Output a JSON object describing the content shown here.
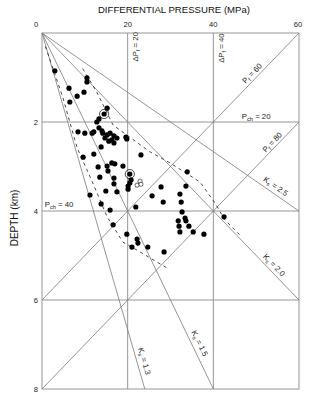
{
  "chart_data": {
    "type": "scatter",
    "title": "DIFFERENTIAL PRESSURE (MPa)",
    "xlabel": "DIFFERENTIAL PRESSURE (MPa)",
    "ylabel": "DEPTH (km)",
    "xlim": [
      0,
      60
    ],
    "ylim": [
      0,
      8
    ],
    "y_inverted": true,
    "x_axis_position": "top",
    "x_ticks": [
      0,
      20,
      40,
      60
    ],
    "y_ticks": [
      2,
      4,
      6,
      8
    ],
    "grid": {
      "horizontal_depths": [
        2,
        4,
        6
      ],
      "vertical_pressures": [
        20,
        40
      ]
    },
    "reference_lines": [
      {
        "name": "Pf = 60",
        "kind": "pore-pressure",
        "from": [
          60,
          0
        ],
        "to": [
          0,
          6
        ]
      },
      {
        "name": "Pf = 80",
        "kind": "pore-pressure",
        "from": [
          60,
          2
        ],
        "to": [
          0,
          8
        ]
      },
      {
        "name": "Ks = 1.3",
        "kind": "stress-ratio",
        "from": [
          0,
          0
        ],
        "to": [
          24,
          8
        ]
      },
      {
        "name": "Ks = 1.5",
        "kind": "stress-ratio",
        "from": [
          0,
          0
        ],
        "to": [
          40,
          8
        ]
      },
      {
        "name": "Ks = 2.0",
        "kind": "stress-ratio",
        "from": [
          0,
          0
        ],
        "to": [
          60,
          6
        ]
      },
      {
        "name": "Ks = 2.5",
        "kind": "stress-ratio",
        "from": [
          0,
          0
        ],
        "to": [
          60,
          4
        ]
      }
    ],
    "envelopes": [
      {
        "name": "left-envelope",
        "style": "dashed",
        "points": [
          [
            0.8,
            0.3
          ],
          [
            4.9,
            1.46
          ],
          [
            8.2,
            2.58
          ],
          [
            12.0,
            3.4
          ],
          [
            15.2,
            4.13
          ],
          [
            18.9,
            4.7
          ],
          [
            22.9,
            4.92
          ],
          [
            26.9,
            5.15
          ],
          [
            29.2,
            5.28
          ]
        ]
      },
      {
        "name": "right-envelope",
        "style": "dashed",
        "points": [
          [
            9.5,
            0.8
          ],
          [
            12.8,
            1.33
          ],
          [
            16.6,
            2.07
          ],
          [
            25.2,
            2.67
          ],
          [
            29.9,
            2.92
          ],
          [
            36.9,
            3.35
          ],
          [
            40.4,
            3.82
          ],
          [
            42.7,
            4.2
          ],
          [
            46.2,
            4.54
          ]
        ]
      }
    ],
    "series": [
      {
        "name": "measured",
        "marker": "filled-circle",
        "points": [
          [
            3.0,
            0.85
          ],
          [
            10.5,
            1.01
          ],
          [
            10.5,
            1.1
          ],
          [
            6.3,
            1.24
          ],
          [
            9.8,
            1.33
          ],
          [
            8.2,
            1.42
          ],
          [
            6.5,
            1.55
          ],
          [
            15.2,
            1.69
          ],
          [
            14.5,
            1.82
          ],
          [
            13.3,
            1.93
          ],
          [
            12.8,
            2.0
          ],
          [
            13.3,
            2.13
          ],
          [
            8.4,
            2.22
          ],
          [
            10.0,
            2.25
          ],
          [
            11.7,
            2.25
          ],
          [
            12.1,
            2.22
          ],
          [
            14.0,
            2.2
          ],
          [
            14.2,
            2.25
          ],
          [
            15.2,
            2.29
          ],
          [
            15.9,
            2.25
          ],
          [
            16.8,
            2.31
          ],
          [
            17.5,
            2.36
          ],
          [
            14.7,
            2.36
          ],
          [
            16.3,
            2.4
          ],
          [
            19.6,
            2.34
          ],
          [
            19.8,
            2.38
          ],
          [
            15.6,
            2.43
          ],
          [
            16.8,
            2.47
          ],
          [
            13.8,
            2.56
          ],
          [
            9.6,
            2.79
          ],
          [
            12.1,
            2.72
          ],
          [
            23.1,
            2.74
          ],
          [
            13.1,
            3.01
          ],
          [
            15.2,
            2.99
          ],
          [
            16.3,
            2.92
          ],
          [
            17.0,
            2.94
          ],
          [
            18.9,
            2.99
          ],
          [
            15.4,
            3.1
          ],
          [
            13.5,
            3.24
          ],
          [
            16.8,
            3.26
          ],
          [
            20.5,
            3.17
          ],
          [
            20.8,
            3.3
          ],
          [
            20.5,
            3.37
          ],
          [
            20.1,
            3.44
          ],
          [
            20.1,
            3.51
          ],
          [
            16.8,
            3.39
          ],
          [
            14.9,
            3.55
          ],
          [
            17.5,
            3.57
          ],
          [
            11.2,
            3.64
          ],
          [
            13.8,
            3.84
          ],
          [
            15.9,
            3.98
          ],
          [
            21.9,
            3.91
          ],
          [
            16.6,
            4.31
          ],
          [
            33.9,
            3.12
          ],
          [
            27.8,
            3.46
          ],
          [
            33.6,
            3.44
          ],
          [
            25.7,
            3.66
          ],
          [
            28.3,
            3.8
          ],
          [
            32.2,
            3.62
          ],
          [
            32.5,
            3.8
          ],
          [
            32.7,
            4.02
          ],
          [
            33.4,
            4.16
          ],
          [
            33.6,
            4.22
          ],
          [
            31.8,
            4.22
          ],
          [
            32.0,
            4.34
          ],
          [
            34.3,
            4.34
          ],
          [
            32.2,
            4.47
          ],
          [
            35.3,
            4.47
          ],
          [
            37.8,
            4.52
          ],
          [
            42.5,
            4.13
          ],
          [
            19.8,
            4.52
          ],
          [
            22.2,
            4.63
          ],
          [
            22.4,
            4.72
          ],
          [
            21.0,
            4.81
          ],
          [
            24.7,
            4.81
          ],
          [
            28.5,
            4.92
          ]
        ]
      },
      {
        "name": "highlighted",
        "marker": "circled-filled-circle",
        "points": [
          [
            14.5,
            1.82
          ],
          [
            20.5,
            3.17
          ]
        ]
      },
      {
        "name": "open",
        "marker": "open-circle",
        "points": [
          [
            22.2,
            3.42
          ],
          [
            22.9,
            3.33
          ],
          [
            23.1,
            3.4
          ]
        ]
      }
    ],
    "annotations": [
      {
        "id": "dpf-20",
        "base": "ΔP",
        "sub": "f",
        "tail": " = 20",
        "at": [
          21.7,
          0.31
        ],
        "angle": -90
      },
      {
        "id": "dpf-40",
        "base": "ΔP",
        "sub": "f",
        "tail": " = 40",
        "at": [
          41.8,
          0.34
        ],
        "angle": -90
      },
      {
        "id": "pf-60",
        "base": "P",
        "sub": "f",
        "tail": " = 60",
        "at": [
          49.0,
          0.9
        ],
        "angle": -46
      },
      {
        "id": "pch-20",
        "base": "P",
        "sub": "ch",
        "tail": " = 20",
        "at": [
          50.0,
          1.87
        ],
        "angle": 0
      },
      {
        "id": "pf-80",
        "base": "P",
        "sub": "f",
        "tail": " = 80",
        "at": [
          53.7,
          2.45
        ],
        "angle": -46
      },
      {
        "id": "ks-2-5",
        "base": "K",
        "sub": "s",
        "tail": " = 2.5",
        "at": [
          54.6,
          3.44
        ],
        "angle": 35
      },
      {
        "id": "pch-40",
        "base": "P",
        "sub": "ch",
        "tail": " = 40",
        "at": [
          4.0,
          3.84
        ],
        "angle": 0
      },
      {
        "id": "ks-2-0",
        "base": "K",
        "sub": "s",
        "tail": " = 2.0",
        "at": [
          54.2,
          5.21
        ],
        "angle": 46
      },
      {
        "id": "ks-1-5",
        "base": "K",
        "sub": "s",
        "tail": " = 1.5",
        "at": [
          36.9,
          6.97
        ],
        "angle": 64
      },
      {
        "id": "ks-1-3",
        "base": "K",
        "sub": "s",
        "tail": " = 1.3",
        "at": [
          24.0,
          7.37
        ],
        "angle": 74
      }
    ]
  }
}
